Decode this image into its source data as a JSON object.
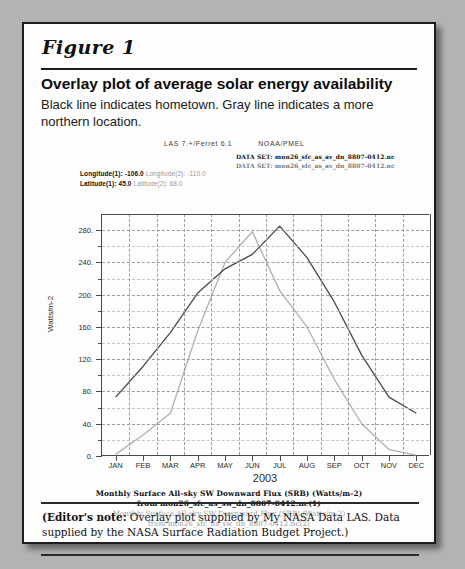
{
  "figure": {
    "label": "Figure 1",
    "title": "Overlay plot of average solar energy availability",
    "subtitle": "Black line indicates hometown. Gray line indicates a more northern location."
  },
  "plot_header": {
    "software": "LAS 7.+/Ferret 6.1",
    "org": "NOAA/PMEL",
    "dataset_1": "DATA SET: mon26_sfc_as_av_dn_8807-0412.nc",
    "dataset_2": "DATA SET: mon26_sfc_as_av_dn_8807-0412.nc"
  },
  "coords": {
    "longitude_1_label": "Longitude(1):",
    "longitude_1_value": "-106.0",
    "longitude_2_label": "Longitude(2):",
    "longitude_2_value": "-110.0",
    "latitude_1_label": "Latitude(1):",
    "latitude_1_value": "45.0",
    "latitude_2_label": "Latitude(2):",
    "latitude_2_value": "68.0"
  },
  "plot_caption": {
    "line1": "Monthly Surface All-sky SW Downward Flux (SRB) (Watts/m-2)",
    "line2": "from mon26_sfc_as_sw_dn_8807-0412.nc(1)",
    "line3": "Monthly Surface All-sky SW Downward Flux (SRB) (Watts/m-2)",
    "line4": "from mon26_sfc_as_sw_dn_8807-0412.nc(2)"
  },
  "editor_note": {
    "prefix": "(Editor's note:",
    "body": " Overlay plot supplied by My NASA Data LAS. Data supplied by the NASA Surface Radiation Budget Project.)"
  },
  "colors": {
    "series_1": "#4a4a4a",
    "series_2": "#b0b0b0",
    "axis": "#4a4a4a",
    "grid": "#9d9d9d",
    "page_background": "#b3b3b3",
    "figure_background": "#fdfdfd"
  },
  "chart_data": {
    "type": "line",
    "title": "Monthly Surface All-sky SW Downward Flux (SRB) (Watts/m-2)",
    "xlabel": "2003",
    "ylabel": "Watts/m-2",
    "categories": [
      "JAN",
      "FEB",
      "MAR",
      "APR",
      "MAY",
      "JUN",
      "JUL",
      "AUG",
      "SEP",
      "OCT",
      "NOV",
      "DEC"
    ],
    "ylim": [
      0,
      300
    ],
    "yticks": [
      0,
      40,
      80,
      120,
      160,
      200,
      240,
      280
    ],
    "ytick_labels": [
      "0.",
      "40.",
      "80.",
      "120.",
      "160.",
      "200.",
      "240.",
      "280."
    ],
    "grid": true,
    "legend_position": "below-plot",
    "series": [
      {
        "name": "mon26_sfc_as_sw_dn_8807-0412.nc(1)",
        "label": "Hometown (Latitude 45.0, Longitude -106.0)",
        "color": "#4a4a4a",
        "values": [
          73,
          111,
          153,
          202,
          232,
          250,
          285,
          246,
          191,
          125,
          73,
          53
        ]
      },
      {
        "name": "mon26_sfc_as_sw_dn_8807-0412.nc(2)",
        "label": "Northern location (Latitude 68.0, Longitude -110.0)",
        "color": "#b0b0b0",
        "values": [
          2,
          26,
          53,
          155,
          240,
          278,
          205,
          160,
          95,
          40,
          8,
          1
        ]
      }
    ]
  }
}
